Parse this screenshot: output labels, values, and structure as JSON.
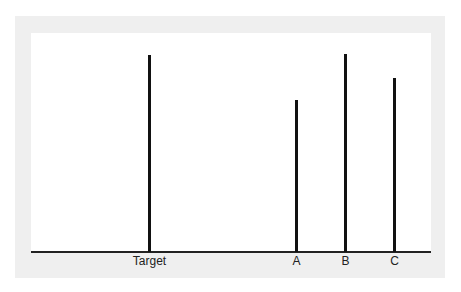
{
  "figure": {
    "background": "#efefef",
    "panel": "#ffffff",
    "line_color": "#111111"
  },
  "chart_data": {
    "type": "bar",
    "title": "",
    "xlabel": "",
    "ylabel": "",
    "categories": [
      "Target",
      "A",
      "B",
      "C"
    ],
    "values": [
      196,
      151,
      197,
      173
    ],
    "units": "relative line length (px)",
    "grid": false,
    "legend": null
  },
  "lines": [
    {
      "label": "Target",
      "x": 149,
      "top": 55
    },
    {
      "label": "A",
      "x": 296,
      "top": 100
    },
    {
      "label": "B",
      "x": 345,
      "top": 54
    },
    {
      "label": "C",
      "x": 394,
      "top": 78
    }
  ]
}
